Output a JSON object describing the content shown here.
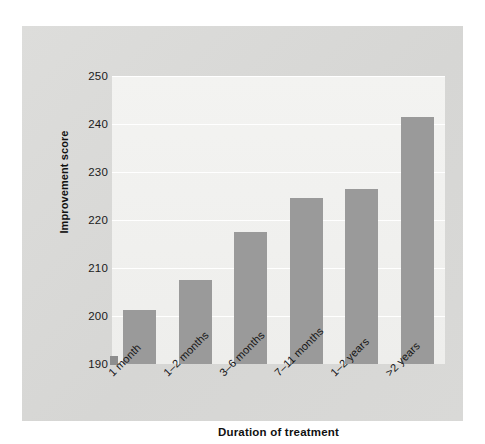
{
  "chart_data": {
    "type": "bar",
    "title": "",
    "xlabel": "Duration of treatment",
    "ylabel": "Improvement score",
    "categories": [
      "1 month",
      "1–2 months",
      "3–6 months",
      "7–11 months",
      "1–2 years",
      ">2 years"
    ],
    "values": [
      201.3,
      207.5,
      217.5,
      224.5,
      226.5,
      241.5
    ],
    "ylim": [
      190,
      250
    ],
    "ytick_labels": [
      "190",
      "200",
      "210",
      "220",
      "230",
      "240",
      "250"
    ],
    "ytick_values": [
      190,
      200,
      210,
      220,
      230,
      240,
      250
    ],
    "grid": true,
    "legend": "none",
    "bar_color": "#9a9a9a",
    "plot_background": "#f1f1ef",
    "panel_background": "#d9d9d7"
  },
  "axes": {
    "y_title": "Improvement score",
    "x_title": "Duration of treatment"
  }
}
